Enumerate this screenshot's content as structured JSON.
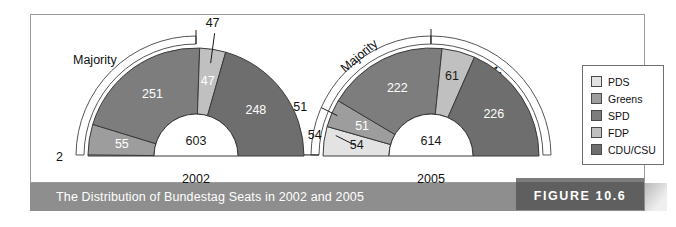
{
  "caption": "The Distribution of Bundestag Seats in 2002 and 2005",
  "figure_badge": "FIGURE 10.6",
  "legend": {
    "items": [
      {
        "label": "PDS",
        "color": "#e3e3e3"
      },
      {
        "label": "Greens",
        "color": "#9d9d9d"
      },
      {
        "label": "SPD",
        "color": "#7d7d7d"
      },
      {
        "label": "FDP",
        "color": "#c0c0c0"
      },
      {
        "label": "CDU/CSU",
        "color": "#6e6e6e"
      }
    ]
  },
  "majority_label": "Majority",
  "chart_data": {
    "type": "pie",
    "title": "The Distribution of Bundestag Seats in 2002 and 2005",
    "subcharts": [
      {
        "year": "2002",
        "total": 603,
        "total_label": "603",
        "categories": [
          "PDS",
          "Greens",
          "SPD",
          "FDP",
          "CDU/CSU"
        ],
        "values": [
          2,
          55,
          251,
          47,
          248
        ],
        "labels": [
          "2",
          "55",
          "251",
          "47",
          "248"
        ],
        "colors": [
          "#e3e3e3",
          "#9d9d9d",
          "#7d7d7d",
          "#c0c0c0",
          "#6e6e6e"
        ],
        "majority_count": 1,
        "majority_labels": [
          "Majority"
        ]
      },
      {
        "year": "2005",
        "total": 614,
        "total_label": "614",
        "categories": [
          "PDS",
          "Greens",
          "SPD",
          "FDP",
          "CDU/CSU"
        ],
        "values": [
          54,
          51,
          222,
          61,
          226
        ],
        "labels": [
          "54",
          "51",
          "222",
          "61",
          "226"
        ],
        "colors": [
          "#e3e3e3",
          "#9d9d9d",
          "#7d7d7d",
          "#c0c0c0",
          "#6e6e6e"
        ],
        "majority_count": 2,
        "majority_labels": [
          "Majority",
          "Majority"
        ]
      }
    ]
  }
}
